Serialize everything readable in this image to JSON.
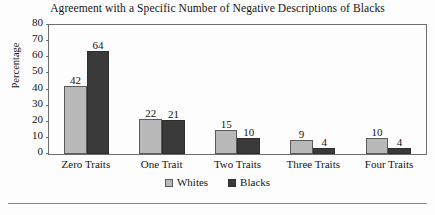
{
  "chart_data": {
    "type": "bar",
    "title": "Agreement with a Specific Number of Negative Descriptions of Blacks",
    "xlabel": "",
    "ylabel": "Percentage",
    "categories": [
      "Zero Traits",
      "One Trait",
      "Two Traits",
      "Three Traits",
      "Four Traits"
    ],
    "series": [
      {
        "name": "Whites",
        "color": "#b9b9b9",
        "values": [
          42,
          22,
          15,
          9,
          10
        ]
      },
      {
        "name": "Blacks",
        "color": "#3a3a3a",
        "values": [
          64,
          21,
          10,
          4,
          4
        ]
      }
    ],
    "ylim": [
      0,
      80
    ],
    "yticks": [
      0,
      10,
      20,
      30,
      40,
      50,
      60,
      70,
      80
    ],
    "ytick_labels": [
      "0",
      "10",
      "20",
      "30",
      "40",
      "50",
      "60",
      "70",
      "80"
    ],
    "grid": false,
    "legend_position": "bottom-center",
    "data_labels": true
  }
}
